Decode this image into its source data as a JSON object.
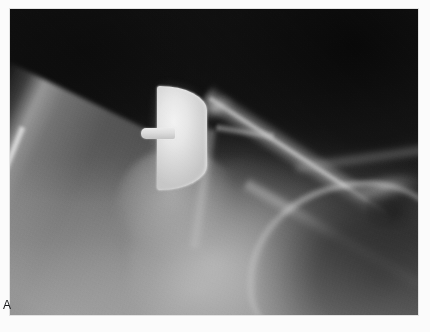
{
  "figure": {
    "panel_label": "A",
    "modality": "radiograph",
    "view": "anteroposterior-shoulder",
    "caption": "",
    "frame": {
      "x": 10,
      "y": 9,
      "width": 408,
      "height": 306
    }
  },
  "palette": {
    "page_background": "#fbfbfb",
    "film_darkest": "#141414",
    "film_dark_field": "#1b1b1b",
    "soft_tissue_mid": "#6a6a6a",
    "bone_mid": "#9a9a9a",
    "bone_bright": "#c8c8c8",
    "metal_implant": "#e6e6e6",
    "metal_highlight": "#f2f2f2",
    "label_text": "#17181a",
    "frame_border": "#e2e2e2"
  },
  "anatomy": [
    {
      "name": "humeral-shaft",
      "label": "Humeral shaft",
      "brightness": "mid-gray",
      "orientation": "diagonal upper-right to lower-left"
    },
    {
      "name": "humeral-cortex",
      "label": "Lateral cortical margin",
      "brightness": "bright line"
    },
    {
      "name": "proximal-humerus",
      "label": "Proximal humeral metaphysis",
      "brightness": "mid-bright"
    },
    {
      "name": "scapula-body",
      "label": "Scapular body / glenoid region",
      "brightness": "mid-bright"
    },
    {
      "name": "glenoid-rim",
      "label": "Glenoid rim",
      "brightness": "faint bright curve"
    },
    {
      "name": "acromion",
      "label": "Acromion / coracoid process",
      "brightness": "bright diagonal band"
    },
    {
      "name": "rib-shadows",
      "label": "Rib shadows",
      "brightness": "bright diagonal bands"
    },
    {
      "name": "lung-field",
      "label": "Lung field",
      "brightness": "dark radiolucent region"
    }
  ],
  "implant": {
    "name": "humeral-head-resurfacing-prosthesis",
    "label": "Humeral head prosthesis",
    "shape": "D-shaped (flat medial surface, convex lateral surface)",
    "material_appearance": "radiopaque metal",
    "components": [
      {
        "name": "implant-head",
        "label": "Prosthetic articular dome"
      },
      {
        "name": "implant-stem",
        "label": "Central fixation peg / stem"
      }
    ]
  }
}
